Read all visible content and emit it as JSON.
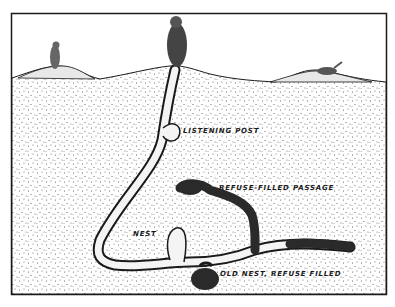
{
  "figure": {
    "type": "cross-section illustration",
    "labels": {
      "listening_post": "LISTENING POST",
      "refuse_passage": "REFUSE-FILLED PASSAGE",
      "nest": "NEST",
      "old_nest": "OLD NEST, REFUSE FILLED"
    },
    "caption": "",
    "colors": {
      "ink": "#1a1a1a",
      "paper": "#ffffff",
      "stipple": "#555555",
      "tunnel": "#f4f4f4",
      "refuse": "#2a2a2a"
    }
  }
}
